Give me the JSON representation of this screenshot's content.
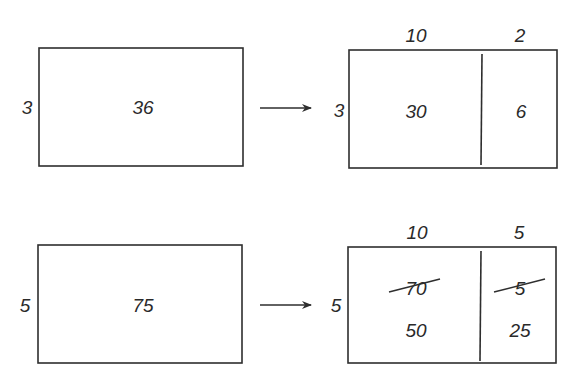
{
  "diagram": {
    "type": "area-model-decomposition",
    "colors": {
      "stroke": "#2e2e2e",
      "text": "#2a2a2a",
      "background": "#ffffff"
    },
    "rows": [
      {
        "original": {
          "side": "3",
          "area": "36"
        },
        "arrow": "right-arrow",
        "split": {
          "side": "3",
          "top_labels": [
            "10",
            "2"
          ],
          "cells": [
            {
              "values": [
                "30"
              ]
            },
            {
              "values": [
                "6"
              ]
            }
          ]
        }
      },
      {
        "original": {
          "side": "5",
          "area": "75"
        },
        "arrow": "right-arrow",
        "split": {
          "side": "5",
          "top_labels": [
            "10",
            "5"
          ],
          "cells": [
            {
              "crossed_out": "70",
              "values": [
                "50"
              ]
            },
            {
              "crossed_out": "5",
              "values": [
                "25"
              ]
            }
          ]
        }
      }
    ]
  }
}
